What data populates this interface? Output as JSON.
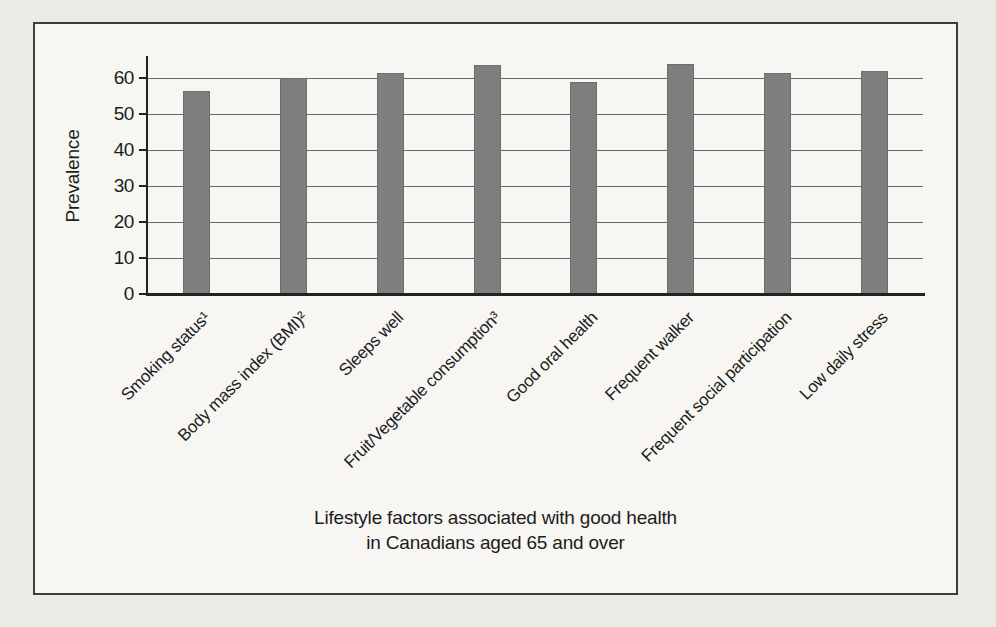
{
  "chart_data": {
    "type": "bar",
    "title": "",
    "categories": [
      "Smoking status¹",
      "Body mass index (BMI)²",
      "Sleeps well",
      "Fruit/Vegetable consumption³",
      "Good oral health",
      "Frequent walker",
      "Frequent social participation",
      "Low daily stress"
    ],
    "values": [
      56.5,
      60,
      61.5,
      63.5,
      59,
      64,
      61.5,
      62
    ],
    "xlabel": "Lifestyle factors associated with good health in Canadians aged 65 and over",
    "xlabel_line1": "Lifestyle factors associated with good health",
    "xlabel_line2": "in Canadians aged 65 and over",
    "ylabel": "Prevalence",
    "ylim": [
      0,
      65.5
    ],
    "yticks": [
      0,
      10,
      20,
      30,
      40,
      50,
      60
    ],
    "grid": true,
    "legend_position": "none",
    "bar_color": "#7e7e7e",
    "grid_color": "#4f4f4f",
    "axis_color": "#222222",
    "text_color": "#1c1c1c",
    "paper_color": "#f7f6f2",
    "page_background": "#eceae5",
    "frame_border_color": "#3d3d3d"
  }
}
